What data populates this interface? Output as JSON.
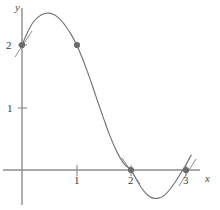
{
  "figure": {
    "title": "",
    "background_color": "#ffffff",
    "width": 220,
    "height": 210
  },
  "axes": {
    "x_axis_label": "x",
    "y_axis_label": "y",
    "axis_color": "#8c8c8c",
    "tick_color": "#8c8c8c"
  },
  "ticks": {
    "x": [
      {
        "value": 1,
        "label": "1"
      },
      {
        "value": 2,
        "label": "2"
      },
      {
        "value": 3,
        "label": "3"
      }
    ],
    "y": [
      {
        "value": 1,
        "label": "1"
      },
      {
        "value": 2,
        "label": "2"
      }
    ]
  },
  "chart_data": {
    "type": "line",
    "title": "",
    "xlabel": "x",
    "ylabel": "y",
    "xlim": [
      -0.22,
      3.35
    ],
    "ylim": [
      -0.55,
      2.78
    ],
    "grid": false,
    "legend": null,
    "curve": {
      "name": "f",
      "color": "#6f6f6f",
      "line_width": 1.1,
      "description": "cubic-like curve: rises from (0,2) to local maximum near (0.52,2.5), falls through (1,2), crosses zero at (2,0), local minimum near (2.4,-0.45), returns to zero at (3,0)",
      "x": [
        0.0,
        0.1,
        0.2,
        0.3,
        0.4,
        0.5,
        0.6,
        0.7,
        0.8,
        0.9,
        1.0,
        1.1,
        1.2,
        1.3,
        1.4,
        1.5,
        1.6,
        1.7,
        1.8,
        1.9,
        2.0,
        2.1,
        2.2,
        2.3,
        2.4,
        2.5,
        2.6,
        2.7,
        2.8,
        2.9,
        3.0,
        3.1
      ],
      "y": [
        2.0,
        2.2,
        2.36,
        2.45,
        2.5,
        2.51,
        2.48,
        2.41,
        2.3,
        2.17,
        2.0,
        1.8,
        1.57,
        1.32,
        1.06,
        0.81,
        0.57,
        0.36,
        0.19,
        0.07,
        0.0,
        -0.16,
        -0.3,
        -0.4,
        -0.45,
        -0.45,
        -0.41,
        -0.32,
        -0.2,
        -0.06,
        0.08,
        0.24
      ]
    },
    "points": [
      {
        "label": "",
        "x": 0,
        "y": 2,
        "color": "#6b6b6b",
        "marker": "circle",
        "has_tangent": true
      },
      {
        "label": "",
        "x": 1,
        "y": 2,
        "color": "#6b6b6b",
        "marker": "circle",
        "has_tangent": false
      },
      {
        "label": "",
        "x": 2,
        "y": 0,
        "color": "#6b6b6b",
        "marker": "circle",
        "has_tangent": true
      },
      {
        "label": "",
        "x": 3,
        "y": 0,
        "color": "#6b6b6b",
        "marker": "circle",
        "has_tangent": true
      }
    ]
  }
}
